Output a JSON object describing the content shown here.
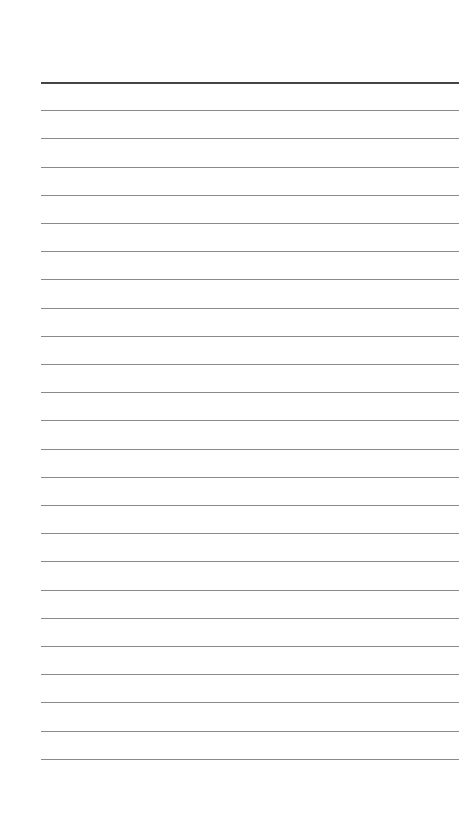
{
  "page": {
    "type": "lined-notepad",
    "background_color": "#ffffff",
    "line_color": "#8a8a8a",
    "header_line_color": "#444444",
    "line_count": 25,
    "first_line_y": 82,
    "line_spacing": 28.2,
    "line_left": 41,
    "line_right": 459,
    "text": []
  }
}
